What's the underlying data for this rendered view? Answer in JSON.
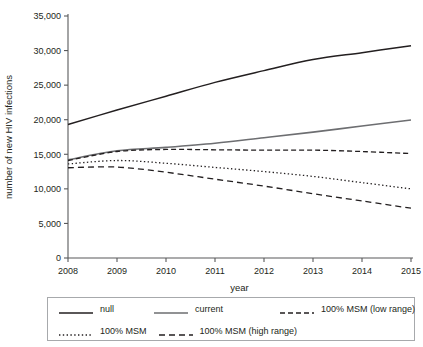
{
  "chart_data": {
    "type": "line",
    "title": "",
    "xlabel": "year",
    "ylabel": "number of new HIV infections",
    "x": [
      2008,
      2009,
      2010,
      2011,
      2012,
      2013,
      2014,
      2015
    ],
    "categories": [
      "2008",
      "2009",
      "2010",
      "2011",
      "2012",
      "2013",
      "2014",
      "2015"
    ],
    "xlim": [
      2008,
      2015
    ],
    "ylim": [
      0,
      35000
    ],
    "yticks": [
      0,
      5000,
      10000,
      15000,
      20000,
      25000,
      30000,
      35000
    ],
    "ytick_labels": [
      "0",
      "5,000",
      "10,000",
      "15,000",
      "20,000",
      "25,000",
      "30,000",
      "35,000"
    ],
    "grid": false,
    "legend_position": "below",
    "series": [
      {
        "name": "null",
        "style": "solid",
        "color": "#231f20",
        "width": 1.5,
        "values": [
          19300,
          21400,
          23400,
          25400,
          27100,
          28700,
          29700,
          30700
        ]
      },
      {
        "name": "current",
        "style": "solid",
        "color": "#6d6e71",
        "width": 1.6,
        "values": [
          14200,
          15500,
          16000,
          16600,
          17400,
          18200,
          19100,
          19950
        ]
      },
      {
        "name": "100% MSM (low range)",
        "style": "dashed",
        "color": "#231f20",
        "width": 1.3,
        "dash": "5,3",
        "values": [
          14100,
          15400,
          15700,
          15650,
          15600,
          15600,
          15400,
          15100
        ]
      },
      {
        "name": "100% MSM",
        "style": "dotted",
        "color": "#231f20",
        "width": 1.3,
        "dash": "1.4,2.4",
        "values": [
          13600,
          14100,
          13700,
          13100,
          12500,
          11800,
          10900,
          10000
        ]
      },
      {
        "name": "100% MSM (high range)",
        "style": "dashed",
        "color": "#231f20",
        "width": 1.3,
        "dash": "6,4",
        "values": [
          13050,
          13150,
          12400,
          11400,
          10400,
          9300,
          8250,
          7200
        ]
      }
    ]
  },
  "legend": {
    "rows": [
      [
        {
          "label": "null",
          "key": 0
        },
        {
          "label": "current",
          "key": 1
        },
        {
          "label": "100% MSM (low range)",
          "key": 2
        }
      ],
      [
        {
          "label": "100% MSM",
          "key": 3
        },
        {
          "label": "100% MSM (high range)",
          "key": 4
        }
      ]
    ]
  }
}
